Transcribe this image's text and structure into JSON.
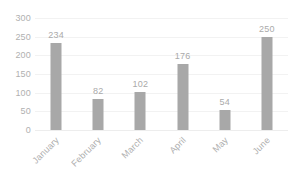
{
  "chart_data": {
    "type": "bar",
    "title": "",
    "subtitle": "",
    "xlabel": "",
    "ylabel": "",
    "categories": [
      "January",
      "February",
      "March",
      "April",
      "May",
      "June"
    ],
    "values": [
      234,
      82,
      102,
      176,
      54,
      250
    ],
    "data_labels": [
      "234",
      "82",
      "102",
      "176",
      "54",
      "250"
    ],
    "ylim": [
      0,
      300
    ],
    "y_ticks": [
      0,
      50,
      100,
      150,
      200,
      250,
      300
    ],
    "y_tick_labels": [
      "0",
      "50",
      "100",
      "150",
      "200",
      "250",
      "300"
    ],
    "grid": true,
    "grid_axis": "y",
    "legend": false,
    "legend_position": "none",
    "orientation": "vertical",
    "series": [
      {
        "name": "",
        "values": [
          234,
          82,
          102,
          176,
          54,
          250
        ]
      }
    ],
    "colors": {
      "bar_fill": "#a8a8a8",
      "gridline": "#f2f2f2",
      "axis_text": "#b0b0b0",
      "data_label_text": "#aaaaaa",
      "background": "#ffffff"
    },
    "x_label_rotation_deg": -45
  }
}
